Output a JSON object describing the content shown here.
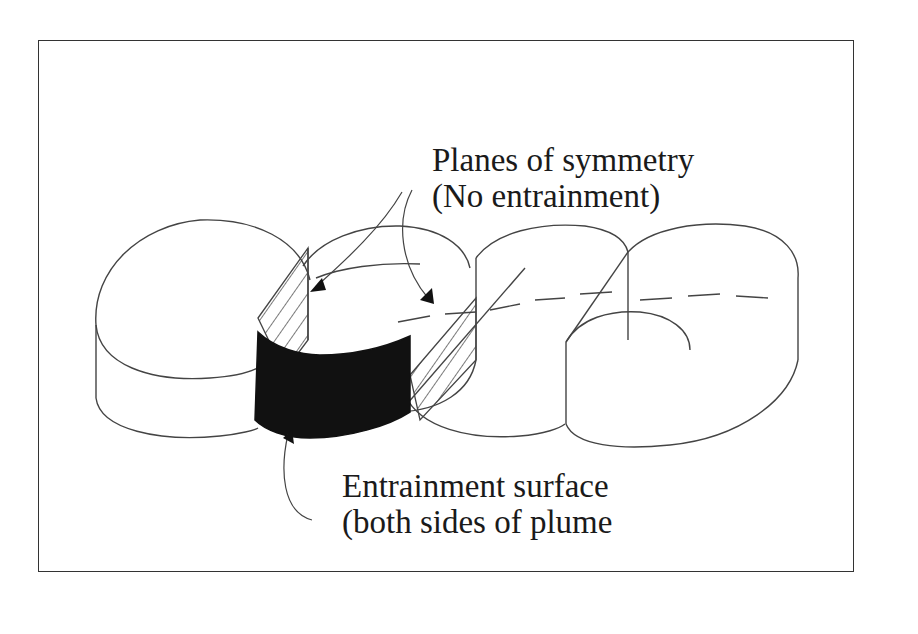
{
  "figure": {
    "labels": {
      "symmetry_line1": "Planes of symmetry",
      "symmetry_line2": "(No entrainment)",
      "entrainment_line1": "Entrainment surface",
      "entrainment_line2": "(both sides of plume"
    },
    "elements": {
      "plume_segments": 4,
      "hatched_planes": 2,
      "filled_surface": 1
    },
    "colors": {
      "line": "#333333",
      "fill_surface": "#111111",
      "background": "#ffffff"
    }
  }
}
